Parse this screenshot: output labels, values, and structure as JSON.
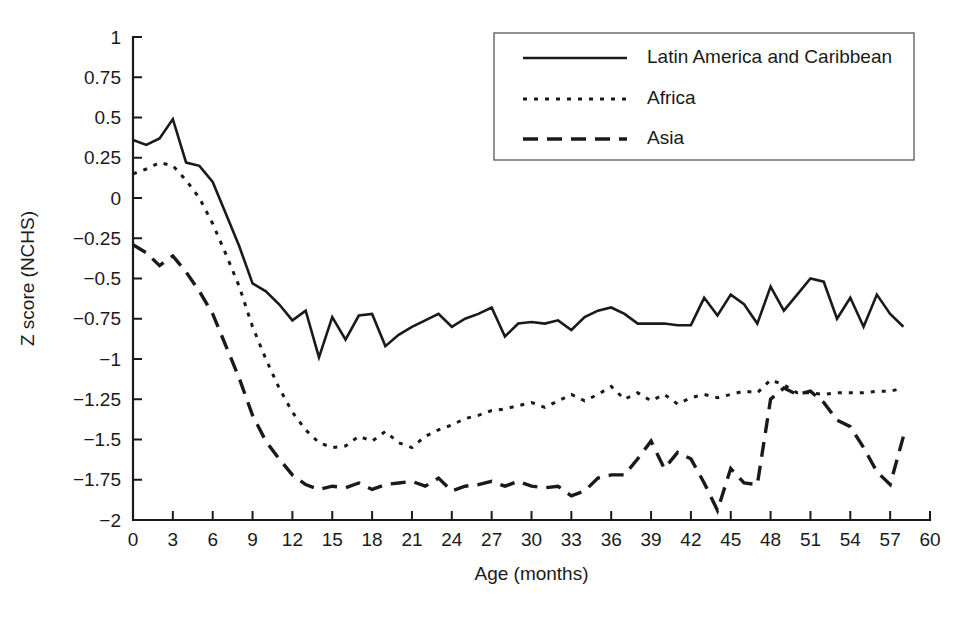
{
  "chart_data": {
    "type": "line",
    "title": "",
    "xlabel": "Age (months)",
    "ylabel": "Z score (NCHS)",
    "xlim": [
      0,
      60
    ],
    "ylim": [
      -2,
      1
    ],
    "grid": false,
    "legend_position": "top-right",
    "xticks": [
      0,
      3,
      6,
      9,
      12,
      15,
      18,
      21,
      24,
      27,
      30,
      33,
      36,
      39,
      42,
      45,
      48,
      51,
      54,
      57,
      60
    ],
    "xtick_labels": [
      "0",
      "3",
      "6",
      "9",
      "12",
      "15",
      "18",
      "21",
      "24",
      "27",
      "30",
      "33",
      "36",
      "39",
      "42",
      "45",
      "48",
      "51",
      "54",
      "57",
      "60"
    ],
    "yticks": [
      1,
      0.75,
      0.5,
      0.25,
      0,
      -0.25,
      -0.5,
      -0.75,
      -1,
      -1.25,
      -1.5,
      -1.75,
      -2
    ],
    "ytick_labels": [
      "1",
      "0.75",
      "0.5",
      "0.25",
      "0",
      "−0.25",
      "−0.5",
      "−0.75",
      "−1",
      "−1.25",
      "−1.5",
      "−1.75",
      "−2"
    ],
    "x": [
      0,
      1,
      2,
      3,
      4,
      5,
      6,
      7,
      8,
      9,
      10,
      11,
      12,
      13,
      14,
      15,
      16,
      17,
      18,
      19,
      20,
      21,
      22,
      23,
      24,
      25,
      26,
      27,
      28,
      29,
      30,
      31,
      32,
      33,
      34,
      35,
      36,
      37,
      38,
      39,
      40,
      41,
      42,
      43,
      44,
      45,
      46,
      47,
      48,
      49,
      50,
      51,
      52,
      53,
      54,
      55,
      56,
      57,
      58
    ],
    "series": [
      {
        "name": "Latin America and Caribbean",
        "style": "solid",
        "color": "#1a1a1a",
        "values": [
          0.36,
          0.33,
          0.37,
          0.49,
          0.22,
          0.2,
          0.1,
          -0.1,
          -0.3,
          -0.53,
          -0.58,
          -0.66,
          -0.76,
          -0.7,
          -0.99,
          -0.74,
          -0.88,
          -0.73,
          -0.72,
          -0.92,
          -0.85,
          -0.8,
          -0.76,
          -0.72,
          -0.8,
          -0.75,
          -0.72,
          -0.68,
          -0.86,
          -0.78,
          -0.77,
          -0.78,
          -0.76,
          -0.82,
          -0.74,
          -0.7,
          -0.68,
          -0.72,
          -0.78,
          -0.78,
          -0.78,
          -0.79,
          -0.79,
          -0.62,
          -0.73,
          -0.6,
          -0.66,
          -0.78,
          -0.55,
          -0.7,
          -0.6,
          -0.5,
          -0.52,
          -0.75,
          -0.62,
          -0.8,
          -0.6,
          -0.72,
          -0.8
        ]
      },
      {
        "name": "Africa",
        "style": "dotted",
        "color": "#1a1a1a",
        "values": [
          0.15,
          0.18,
          0.22,
          0.2,
          0.11,
          0.0,
          -0.16,
          -0.35,
          -0.55,
          -0.8,
          -1.0,
          -1.18,
          -1.33,
          -1.44,
          -1.52,
          -1.55,
          -1.54,
          -1.48,
          -1.51,
          -1.45,
          -1.52,
          -1.55,
          -1.48,
          -1.44,
          -1.41,
          -1.37,
          -1.35,
          -1.32,
          -1.31,
          -1.29,
          -1.27,
          -1.3,
          -1.26,
          -1.22,
          -1.26,
          -1.22,
          -1.17,
          -1.25,
          -1.21,
          -1.26,
          -1.22,
          -1.28,
          -1.24,
          -1.22,
          -1.24,
          -1.22,
          -1.2,
          -1.21,
          -1.13,
          -1.16,
          -1.21,
          -1.21,
          -1.22,
          -1.21,
          -1.21,
          -1.21,
          -1.2,
          -1.2,
          -1.18
        ]
      },
      {
        "name": "Asia",
        "style": "dashed",
        "color": "#1a1a1a",
        "values": [
          -0.29,
          -0.34,
          -0.42,
          -0.36,
          -0.46,
          -0.58,
          -0.72,
          -0.92,
          -1.12,
          -1.35,
          -1.51,
          -1.62,
          -1.72,
          -1.78,
          -1.81,
          -1.79,
          -1.8,
          -1.77,
          -1.81,
          -1.78,
          -1.77,
          -1.76,
          -1.79,
          -1.74,
          -1.82,
          -1.79,
          -1.78,
          -1.76,
          -1.79,
          -1.76,
          -1.79,
          -1.8,
          -1.79,
          -1.85,
          -1.82,
          -1.74,
          -1.72,
          -1.72,
          -1.62,
          -1.51,
          -1.68,
          -1.58,
          -1.62,
          -1.77,
          -1.94,
          -1.68,
          -1.77,
          -1.78,
          -1.25,
          -1.18,
          -1.22,
          -1.2,
          -1.27,
          -1.38,
          -1.42,
          -1.55,
          -1.7,
          -1.78,
          -1.48
        ]
      }
    ]
  },
  "legend": {
    "items": [
      {
        "label": "Latin America and Caribbean",
        "style": "solid"
      },
      {
        "label": "Africa",
        "style": "dotted"
      },
      {
        "label": "Asia",
        "style": "dashed"
      }
    ]
  }
}
